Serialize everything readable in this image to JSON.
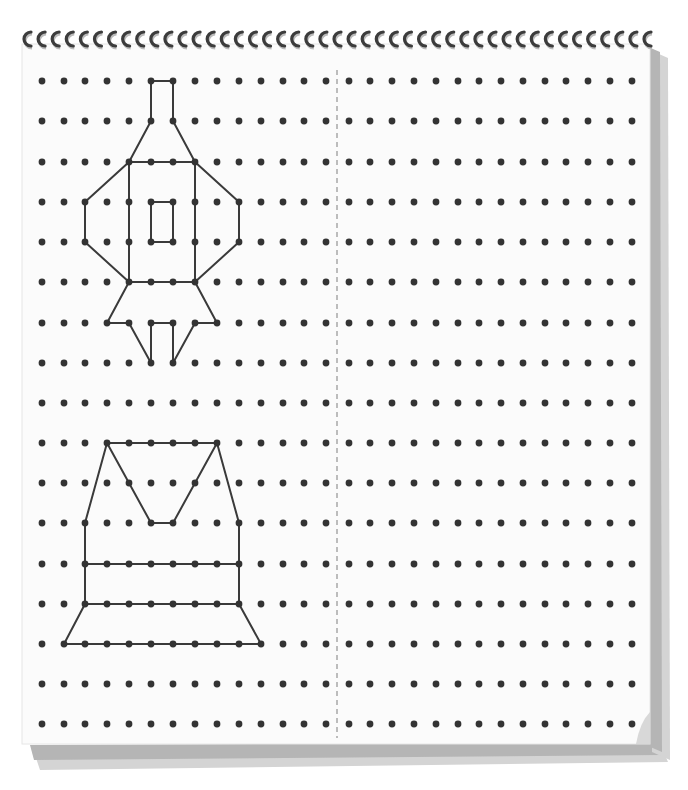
{
  "worksheet": {
    "type": "dot-grid-symmetry-copy",
    "colors": {
      "paper": "#fbfbfb",
      "dot": "#333333",
      "line": "#3a3a3a",
      "divider": "#9a9a9a",
      "edge_light": "#d4d4d4",
      "edge_dark": "#b5b5b5",
      "spiral": "#3c3c3c"
    },
    "grid": {
      "columns": 28,
      "rows": 17,
      "left_x": [
        42,
        64,
        85,
        107,
        129,
        151,
        173,
        195,
        217,
        239,
        261,
        283,
        304,
        326
      ],
      "right_x": [
        349,
        370,
        392,
        414,
        436,
        458,
        479,
        501,
        523,
        545,
        566,
        588,
        610,
        632
      ],
      "row_y": [
        81,
        121,
        162,
        202,
        242,
        282,
        323,
        363,
        403,
        443,
        483,
        523,
        564,
        604,
        644,
        684,
        724
      ]
    },
    "divider": {
      "x": 337,
      "y1": 70,
      "y2": 738,
      "style": "dashed"
    },
    "figures": [
      {
        "name": "rocket",
        "segments": [
          [
            [
              5,
              0
            ],
            [
              6,
              0
            ]
          ],
          [
            [
              5,
              0
            ],
            [
              5,
              1
            ]
          ],
          [
            [
              6,
              0
            ],
            [
              6,
              1
            ]
          ],
          [
            [
              5,
              1
            ],
            [
              4,
              2
            ]
          ],
          [
            [
              6,
              1
            ],
            [
              7,
              2
            ]
          ],
          [
            [
              4,
              2
            ],
            [
              7,
              2
            ]
          ],
          [
            [
              4,
              2
            ],
            [
              4,
              5
            ]
          ],
          [
            [
              7,
              2
            ],
            [
              7,
              5
            ]
          ],
          [
            [
              4,
              5
            ],
            [
              7,
              5
            ]
          ],
          [
            [
              4,
              2
            ],
            [
              2,
              3
            ]
          ],
          [
            [
              2,
              3
            ],
            [
              2,
              4
            ]
          ],
          [
            [
              2,
              4
            ],
            [
              4,
              5
            ]
          ],
          [
            [
              7,
              2
            ],
            [
              9,
              3
            ]
          ],
          [
            [
              9,
              3
            ],
            [
              9,
              4
            ]
          ],
          [
            [
              9,
              4
            ],
            [
              7,
              5
            ]
          ],
          [
            [
              5,
              3
            ],
            [
              6,
              3
            ]
          ],
          [
            [
              6,
              3
            ],
            [
              6,
              4
            ]
          ],
          [
            [
              6,
              4
            ],
            [
              5,
              4
            ]
          ],
          [
            [
              5,
              4
            ],
            [
              5,
              3
            ]
          ],
          [
            [
              4,
              5
            ],
            [
              3,
              6
            ]
          ],
          [
            [
              3,
              6
            ],
            [
              4,
              6
            ]
          ],
          [
            [
              4,
              6
            ],
            [
              5,
              7
            ]
          ],
          [
            [
              7,
              5
            ],
            [
              8,
              6
            ]
          ],
          [
            [
              8,
              6
            ],
            [
              7,
              6
            ]
          ],
          [
            [
              7,
              6
            ],
            [
              6,
              7
            ]
          ],
          [
            [
              5,
              7
            ],
            [
              5,
              6
            ]
          ],
          [
            [
              5,
              6
            ],
            [
              6,
              6
            ]
          ],
          [
            [
              6,
              6
            ],
            [
              6,
              7
            ]
          ]
        ]
      },
      {
        "name": "vest",
        "segments": [
          [
            [
              3,
              9
            ],
            [
              8,
              9
            ]
          ],
          [
            [
              3,
              9
            ],
            [
              2,
              11
            ]
          ],
          [
            [
              3,
              9
            ],
            [
              5,
              11
            ]
          ],
          [
            [
              5,
              11
            ],
            [
              6,
              11
            ]
          ],
          [
            [
              6,
              11
            ],
            [
              8,
              9
            ]
          ],
          [
            [
              8,
              9
            ],
            [
              9,
              11
            ]
          ],
          [
            [
              2,
              11
            ],
            [
              2,
              13
            ]
          ],
          [
            [
              9,
              11
            ],
            [
              9,
              13
            ]
          ],
          [
            [
              2,
              12
            ],
            [
              9,
              12
            ]
          ],
          [
            [
              2,
              13
            ],
            [
              9,
              13
            ]
          ],
          [
            [
              2,
              13
            ],
            [
              1,
              14
            ]
          ],
          [
            [
              9,
              13
            ],
            [
              10,
              14
            ]
          ],
          [
            [
              1,
              14
            ],
            [
              10,
              14
            ]
          ]
        ]
      }
    ],
    "spiral": {
      "x_start": 25,
      "x_end": 645,
      "ring_count": 45,
      "y": 38
    }
  }
}
